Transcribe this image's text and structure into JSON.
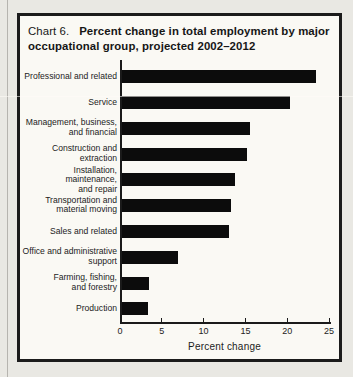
{
  "page": {
    "title_prefix": "Chart 6.",
    "title_main": "Percent change in total employment by major occupational group, projected 2002–2012"
  },
  "chart_data": {
    "type": "bar",
    "orientation": "horizontal",
    "categories": [
      "Professional and related",
      "Service",
      "Management, business, and financial",
      "Construction and extraction",
      "Installation, maintenance, and repair",
      "Transportation and material moving",
      "Sales and related",
      "Office and administrative support",
      "Farming, fishing, and forestry",
      "Production"
    ],
    "category_lines": [
      [
        "Professional and related"
      ],
      [
        "Service"
      ],
      [
        "Management, business,",
        "and financial"
      ],
      [
        "Construction and",
        "extraction"
      ],
      [
        "Installation, maintenance,",
        "and repair"
      ],
      [
        "Transportation and",
        "material moving"
      ],
      [
        "Sales and related"
      ],
      [
        "Office and administrative",
        "support"
      ],
      [
        "Farming, fishing,",
        "and forestry"
      ],
      [
        "Production"
      ]
    ],
    "values": [
      23.3,
      20.1,
      15.4,
      15.0,
      13.6,
      13.1,
      12.9,
      6.8,
      3.3,
      3.2
    ],
    "xlabel": "Percent change",
    "xlim": [
      0,
      25
    ],
    "xticks": [
      0,
      5,
      10,
      15,
      20,
      25
    ],
    "bar_color": "#0c0c0c",
    "grid": false,
    "legend": false
  }
}
